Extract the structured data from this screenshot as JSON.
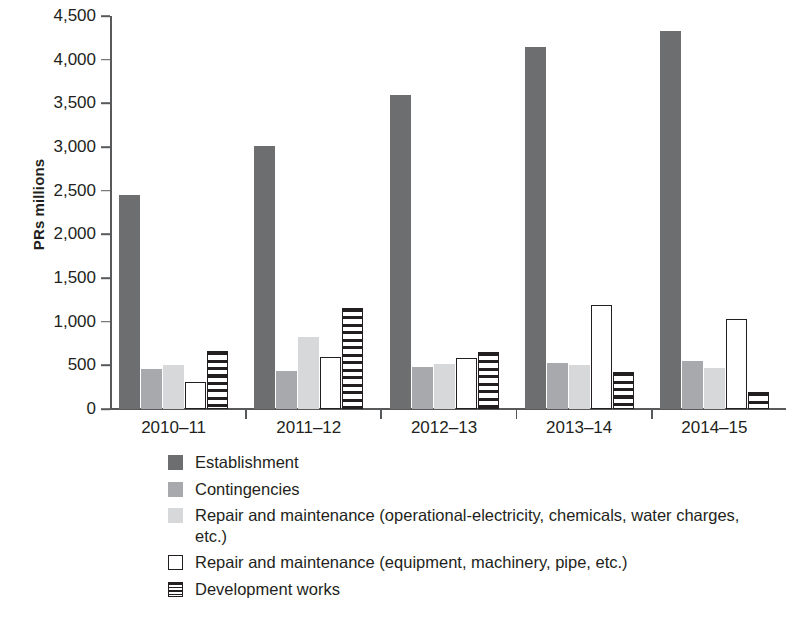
{
  "chart_data": {
    "type": "bar",
    "title": "",
    "xlabel": "",
    "ylabel": "PRs millions",
    "ylim": [
      0,
      4500
    ],
    "ytick_step": 500,
    "grid": false,
    "legend_position": "bottom",
    "categories": [
      "2010–11",
      "2011–12",
      "2012–13",
      "2013–14",
      "2014–15"
    ],
    "ytick_labels": [
      "4,500",
      "4,000",
      "3,500",
      "3,000",
      "2,500",
      "2,000",
      "1,500",
      "1,000",
      "500",
      "0"
    ],
    "ytick_values": [
      4500,
      4000,
      3500,
      3000,
      2500,
      2000,
      1500,
      1000,
      500,
      0
    ],
    "series": [
      {
        "name": "Establishment",
        "key": "establishment",
        "color": "#6d6e70",
        "values": [
          2450,
          3010,
          3590,
          4140,
          4330
        ]
      },
      {
        "name": "Contingencies",
        "key": "contingencies",
        "color": "#a7a9ac",
        "values": [
          455,
          440,
          480,
          525,
          545
        ]
      },
      {
        "name": "Repair and maintenance (operational-electricity, chemicals, water charges, etc.)",
        "key": "repair-op",
        "color": "#d7d8da",
        "values": [
          505,
          825,
          520,
          500,
          465
        ]
      },
      {
        "name": "Repair and maintenance (equipment, machinery, pipe, etc.)",
        "key": "repair-eq",
        "color": "#ffffff",
        "values": [
          315,
          600,
          580,
          1190,
          1030
        ]
      },
      {
        "name": "Development works",
        "key": "development",
        "color": "#ffffff",
        "values": [
          665,
          1160,
          655,
          425,
          195
        ]
      }
    ]
  },
  "legend": {
    "items": [
      {
        "label": "Establishment",
        "swatch": "sw-establishment"
      },
      {
        "label": "Contingencies",
        "swatch": "sw-contingencies"
      },
      {
        "label": "Repair and maintenance (operational-electricity, chemicals, water charges, etc.)",
        "swatch": "sw-repair-op"
      },
      {
        "label": "Repair and maintenance (equipment, machinery, pipe, etc.)",
        "swatch": "sw-repair-eq"
      },
      {
        "label": "Development works",
        "swatch": "sw-development"
      }
    ]
  },
  "colors": {
    "axis": "#58595b",
    "text": "#231f20",
    "background": "#ffffff"
  }
}
